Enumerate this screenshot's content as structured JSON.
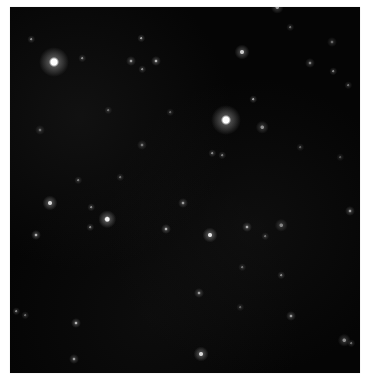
{
  "image": {
    "description": "Astronomical deep-field image showing scattered stars and faint galaxies on a black background",
    "background_color": "#050505",
    "border_color": "#ffffff"
  },
  "stars": [
    {
      "x": 44,
      "y": 55,
      "r": 6,
      "b": 1.0
    },
    {
      "x": 216,
      "y": 113,
      "r": 6,
      "b": 1.0
    },
    {
      "x": 232,
      "y": 45,
      "r": 3,
      "b": 0.8
    },
    {
      "x": 146,
      "y": 54,
      "r": 2,
      "b": 0.7
    },
    {
      "x": 121,
      "y": 54,
      "r": 2,
      "b": 0.6
    },
    {
      "x": 131,
      "y": 31,
      "r": 1.5,
      "b": 0.6
    },
    {
      "x": 132,
      "y": 62,
      "r": 1.5,
      "b": 0.5
    },
    {
      "x": 72,
      "y": 51,
      "r": 1.5,
      "b": 0.5
    },
    {
      "x": 21,
      "y": 32,
      "r": 1.5,
      "b": 0.5
    },
    {
      "x": 98,
      "y": 103,
      "r": 1.5,
      "b": 0.4
    },
    {
      "x": 132,
      "y": 138,
      "r": 2,
      "b": 0.45
    },
    {
      "x": 30,
      "y": 123,
      "r": 2,
      "b": 0.4
    },
    {
      "x": 68,
      "y": 173,
      "r": 1.5,
      "b": 0.45
    },
    {
      "x": 300,
      "y": 56,
      "r": 2,
      "b": 0.5
    },
    {
      "x": 280,
      "y": 20,
      "r": 1.5,
      "b": 0.4
    },
    {
      "x": 322,
      "y": 35,
      "r": 2,
      "b": 0.4
    },
    {
      "x": 323,
      "y": 64,
      "r": 1.5,
      "b": 0.5
    },
    {
      "x": 243,
      "y": 92,
      "r": 1.5,
      "b": 0.6
    },
    {
      "x": 252,
      "y": 120,
      "r": 2.5,
      "b": 0.55
    },
    {
      "x": 202,
      "y": 146,
      "r": 1.5,
      "b": 0.5
    },
    {
      "x": 212,
      "y": 148,
      "r": 1.5,
      "b": 0.45
    },
    {
      "x": 267,
      "y": 0,
      "r": 2.5,
      "b": 0.6
    },
    {
      "x": 338,
      "y": 78,
      "r": 1.5,
      "b": 0.4
    },
    {
      "x": 40,
      "y": 196,
      "r": 3,
      "b": 0.85
    },
    {
      "x": 97,
      "y": 212,
      "r": 3.5,
      "b": 0.95
    },
    {
      "x": 26,
      "y": 228,
      "r": 2,
      "b": 0.7
    },
    {
      "x": 80,
      "y": 220,
      "r": 1.5,
      "b": 0.5
    },
    {
      "x": 81,
      "y": 200,
      "r": 1.5,
      "b": 0.5
    },
    {
      "x": 156,
      "y": 222,
      "r": 2,
      "b": 0.7
    },
    {
      "x": 173,
      "y": 196,
      "r": 2,
      "b": 0.6
    },
    {
      "x": 200,
      "y": 228,
      "r": 3,
      "b": 0.9
    },
    {
      "x": 237,
      "y": 220,
      "r": 2,
      "b": 0.65
    },
    {
      "x": 271,
      "y": 218,
      "r": 2.5,
      "b": 0.5
    },
    {
      "x": 340,
      "y": 204,
      "r": 2,
      "b": 0.6
    },
    {
      "x": 6,
      "y": 304,
      "r": 1.5,
      "b": 0.5
    },
    {
      "x": 15,
      "y": 308,
      "r": 1.5,
      "b": 0.4
    },
    {
      "x": 66,
      "y": 316,
      "r": 2,
      "b": 0.7
    },
    {
      "x": 64,
      "y": 352,
      "r": 2,
      "b": 0.6
    },
    {
      "x": 189,
      "y": 286,
      "r": 2,
      "b": 0.6
    },
    {
      "x": 232,
      "y": 260,
      "r": 1.5,
      "b": 0.4
    },
    {
      "x": 271,
      "y": 268,
      "r": 1.5,
      "b": 0.5
    },
    {
      "x": 191,
      "y": 347,
      "r": 3,
      "b": 0.85
    },
    {
      "x": 230,
      "y": 300,
      "r": 1.5,
      "b": 0.35
    },
    {
      "x": 281,
      "y": 309,
      "r": 2,
      "b": 0.6
    },
    {
      "x": 334,
      "y": 333,
      "r": 2.5,
      "b": 0.55
    },
    {
      "x": 341,
      "y": 336,
      "r": 1.5,
      "b": 0.4
    },
    {
      "x": 255,
      "y": 229,
      "r": 1.5,
      "b": 0.4
    },
    {
      "x": 110,
      "y": 170,
      "r": 1.5,
      "b": 0.4
    },
    {
      "x": 160,
      "y": 105,
      "r": 1.5,
      "b": 0.35
    },
    {
      "x": 290,
      "y": 140,
      "r": 1.5,
      "b": 0.35
    },
    {
      "x": 330,
      "y": 150,
      "r": 1.5,
      "b": 0.3
    }
  ]
}
